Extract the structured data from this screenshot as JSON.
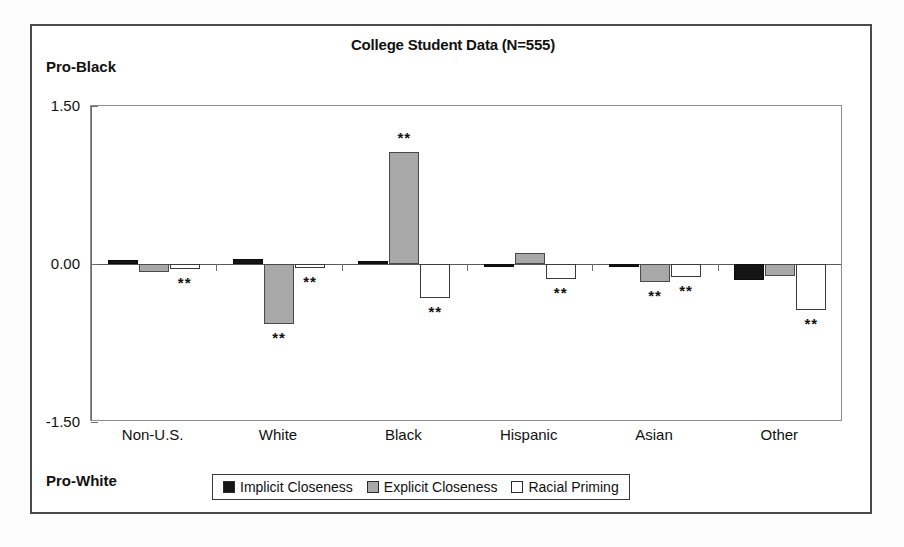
{
  "figure": {
    "title": "College Student Data (N=555)",
    "top_pole_label": "Pro-Black",
    "bottom_pole_label": "Pro-White"
  },
  "legend": {
    "items": [
      {
        "label": "Implicit Closeness",
        "swatch": "black-square-swatch",
        "color": "#151515"
      },
      {
        "label": "Explicit Closeness",
        "swatch": "gray-square-swatch",
        "color": "#a8a8a8"
      },
      {
        "label": "Racial Priming",
        "swatch": "white-square-swatch",
        "color": "#ffffff"
      }
    ]
  },
  "axis": {
    "yticks": [
      "1.50",
      "0.00",
      "-1.50"
    ],
    "ytick_values": [
      1.5,
      0.0,
      -1.5
    ]
  },
  "chart_data": {
    "type": "bar",
    "title": "College Student Data (N=555)",
    "xlabel": "",
    "ylabel": "",
    "ylim": [
      -1.5,
      1.5
    ],
    "yticks": [
      1.5,
      0.0,
      -1.5
    ],
    "grid": false,
    "legend_position": "bottom",
    "annotations": {
      "top_axis_pole": "Pro-Black",
      "bottom_axis_pole": "Pro-White",
      "significance_marker": "**"
    },
    "categories": [
      "Non-U.S.",
      "White",
      "Black",
      "Hispanic",
      "Asian",
      "Other"
    ],
    "series": [
      {
        "name": "Implicit Closeness",
        "color": "#151515",
        "values": [
          0.04,
          0.05,
          0.03,
          -0.03,
          -0.02,
          -0.15
        ],
        "significance": [
          "",
          "",
          "",
          "",
          "",
          ""
        ]
      },
      {
        "name": "Explicit Closeness",
        "color": "#a8a8a8",
        "values": [
          -0.08,
          -0.57,
          1.06,
          0.1,
          -0.17,
          -0.11
        ],
        "significance": [
          "",
          "**",
          "**",
          "",
          "**",
          ""
        ]
      },
      {
        "name": "Racial Priming",
        "color": "#ffffff",
        "values": [
          -0.05,
          -0.04,
          -0.32,
          -0.14,
          -0.12,
          -0.44
        ],
        "significance": [
          "**",
          "**",
          "**",
          "**",
          "**",
          "**"
        ]
      }
    ]
  }
}
